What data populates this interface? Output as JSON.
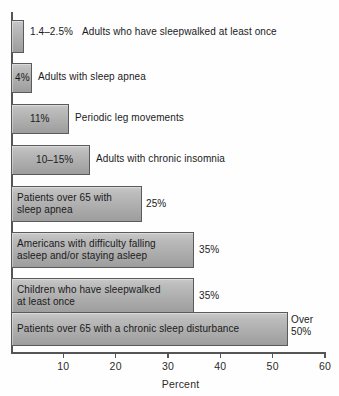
{
  "chart_data": {
    "type": "bar",
    "orientation": "horizontal",
    "title": "",
    "xlabel": "Percent",
    "ylabel": "",
    "xlim": [
      0,
      60
    ],
    "xticks": [
      "10",
      "20",
      "30",
      "40",
      "50",
      "60"
    ],
    "xtick_values": [
      10,
      20,
      30,
      40,
      50,
      60
    ],
    "grid": false,
    "legend": "none",
    "categories": [
      "Adults who have sleepwalked at least once",
      "Adults with sleep apnea",
      "Periodic leg movements",
      "Adults with chronic insomnia",
      "Patients over 65 with\nsleep apnea",
      "Americans with difficulty falling\nasleep and/or staying asleep",
      "Children who have sleepwalked\nat least once",
      "Patients over 65 with a chronic sleep disturbance"
    ],
    "values": [
      2.5,
      4,
      11,
      15,
      25,
      35,
      35,
      53
    ],
    "value_labels": [
      "1.4–2.5%",
      "4%",
      "11%",
      "10–15%",
      "25%",
      "35%",
      "35%",
      "Over\n50%"
    ],
    "bars": [
      {
        "label": "Adults who have sleepwalked at least once",
        "value": 2.5,
        "value_label": "1.4–2.5%",
        "label_placement": "outside",
        "value_placement": "outside"
      },
      {
        "label": "Adults with sleep apnea",
        "value": 4,
        "value_label": "4%",
        "label_placement": "outside",
        "value_placement": "inside"
      },
      {
        "label": "Periodic leg movements",
        "value": 11,
        "value_label": "11%",
        "label_placement": "outside",
        "value_placement": "inside"
      },
      {
        "label": "Adults with chronic insomnia",
        "value": 15,
        "value_label": "10–15%",
        "label_placement": "outside",
        "value_placement": "inside"
      },
      {
        "label": "Patients over 65 with\nsleep apnea",
        "value": 25,
        "value_label": "25%",
        "label_placement": "inside",
        "value_placement": "outside"
      },
      {
        "label": "Americans with difficulty falling\nasleep and/or staying asleep",
        "value": 35,
        "value_label": "35%",
        "label_placement": "inside",
        "value_placement": "outside"
      },
      {
        "label": "Children who have sleepwalked\nat least once",
        "value": 35,
        "value_label": "35%",
        "label_placement": "inside",
        "value_placement": "outside"
      },
      {
        "label": "Patients over 65 with a chronic sleep disturbance",
        "value": 53,
        "value_label": "Over\n50%",
        "label_placement": "inside",
        "value_placement": "outside"
      }
    ],
    "colors": {
      "bar_fill_light": "#c9c9c9",
      "bar_fill_dark": "#9d9d9d",
      "bar_border": "#5a5a5a",
      "axis": "#555555",
      "text": "#1a1a1a",
      "background": "#fefefe"
    }
  }
}
